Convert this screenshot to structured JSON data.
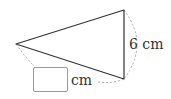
{
  "diagram": {
    "type": "isosceles-triangle-with-dimension-arcs",
    "known_side": {
      "value": "6",
      "unit": "cm",
      "label": "6 cm"
    },
    "unknown_side": {
      "answer": "",
      "unit_label": "cm"
    },
    "colors": {
      "stroke": "#333333",
      "dashed": "#9a9a9a",
      "text": "#333333",
      "box_border": "#9a9a9a"
    }
  }
}
